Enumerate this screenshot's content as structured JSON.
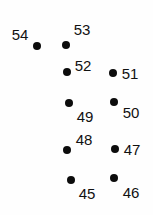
{
  "canvas": {
    "width": 153,
    "height": 215,
    "background_color": "#fefefe"
  },
  "style": {
    "dot_color": "#0c0c0c",
    "label_color": "#111111",
    "dot_diameter": 8,
    "label_font_size": 15
  },
  "chart_data": {
    "type": "scatter",
    "title": "",
    "subtitle": "",
    "xlabel": "",
    "ylabel": "",
    "grid": false,
    "legend": null,
    "axes_visible": false,
    "tick_labels_x": [],
    "tick_labels_y": [],
    "xlim": [
      0,
      153
    ],
    "ylim": [
      0,
      215
    ],
    "point_count": 10,
    "labels": [
      "54",
      "53",
      "52",
      "51",
      "49",
      "50",
      "48",
      "47",
      "45",
      "46"
    ],
    "points": [
      {
        "label": "54",
        "dot_x": 37,
        "dot_y": 46,
        "label_x": 20,
        "label_y": 34,
        "label_position": "upper-left"
      },
      {
        "label": "53",
        "dot_x": 66,
        "dot_y": 45,
        "label_x": 82,
        "label_y": 29,
        "label_position": "upper-right"
      },
      {
        "label": "52",
        "dot_x": 67,
        "dot_y": 72,
        "label_x": 83,
        "label_y": 65,
        "label_position": "upper-right"
      },
      {
        "label": "51",
        "dot_x": 113,
        "dot_y": 73,
        "label_x": 130,
        "label_y": 73,
        "label_position": "right"
      },
      {
        "label": "49",
        "dot_x": 69,
        "dot_y": 103,
        "label_x": 85,
        "label_y": 116,
        "label_position": "lower-right"
      },
      {
        "label": "50",
        "dot_x": 114,
        "dot_y": 102,
        "label_x": 131,
        "label_y": 112,
        "label_position": "lower-right"
      },
      {
        "label": "48",
        "dot_x": 67,
        "dot_y": 150,
        "label_x": 84,
        "label_y": 139,
        "label_position": "upper-right"
      },
      {
        "label": "47",
        "dot_x": 115,
        "dot_y": 149,
        "label_x": 132,
        "label_y": 149,
        "label_position": "right"
      },
      {
        "label": "45",
        "dot_x": 71,
        "dot_y": 180,
        "label_x": 87,
        "label_y": 193,
        "label_position": "lower-right"
      },
      {
        "label": "46",
        "dot_x": 114,
        "dot_y": 178,
        "label_x": 131,
        "label_y": 192,
        "label_position": "lower-right"
      }
    ]
  }
}
